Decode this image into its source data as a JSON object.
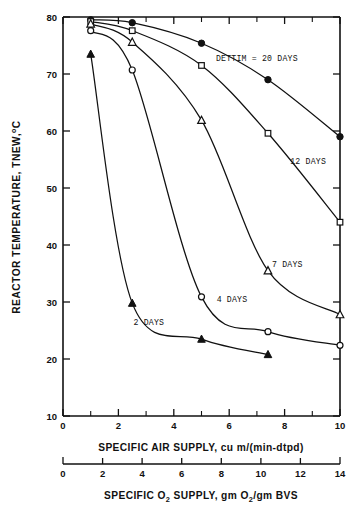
{
  "chart_data": {
    "type": "line",
    "title": "",
    "xlabel": "SPECIFIC AIR SUPPLY, cu m/(min-dtpd)",
    "xlabel_secondary": "SPECIFIC O2 SUPPLY, gm O2/gm BVS",
    "ylabel": "REACTOR TEMPERATURE, TNEW, °C",
    "xlim": [
      0,
      10
    ],
    "ylim": [
      10,
      80
    ],
    "xticks": [
      0,
      2,
      4,
      6,
      8,
      10
    ],
    "xticklabels": [
      "0",
      "2",
      "4",
      "6",
      "8",
      "10"
    ],
    "xticks_minor": [
      1,
      3,
      5,
      7,
      9
    ],
    "yticks": [
      10,
      20,
      30,
      40,
      50,
      60,
      70,
      80
    ],
    "yticklabels": [
      "10",
      "20",
      "30",
      "40",
      "50",
      "60",
      "70",
      "80"
    ],
    "xlim_secondary": [
      0,
      14
    ],
    "xticks_secondary": [
      0,
      2,
      4,
      6,
      8,
      10,
      12,
      14
    ],
    "xticklabels_secondary": [
      "0",
      "2",
      "4",
      "6",
      "8",
      "10",
      "12",
      "14"
    ],
    "grid": false,
    "legend": "inline-annotations",
    "series": [
      {
        "name": "DETTIM = 20 DAYS",
        "marker": "filled-circle",
        "x": [
          1.0,
          2.5,
          5.0,
          7.4,
          10.0
        ],
        "y": [
          79.5,
          79.0,
          75.4,
          69.0,
          59.0
        ]
      },
      {
        "name": "12 DAYS",
        "marker": "open-square",
        "x": [
          1.0,
          2.5,
          5.0,
          7.4,
          10.0
        ],
        "y": [
          79.2,
          77.6,
          71.5,
          59.6,
          44.0
        ]
      },
      {
        "name": "7 DAYS",
        "marker": "open-triangle",
        "x": [
          1.0,
          2.5,
          5.0,
          7.4,
          10.0
        ],
        "y": [
          78.8,
          75.6,
          61.9,
          35.5,
          27.8
        ]
      },
      {
        "name": "4 DAYS",
        "marker": "open-circle",
        "x": [
          1.0,
          2.5,
          5.0,
          7.4,
          10.0
        ],
        "y": [
          77.6,
          70.7,
          30.9,
          24.8,
          22.4
        ]
      },
      {
        "name": "2 DAYS",
        "marker": "filled-triangle",
        "x": [
          1.0,
          2.5,
          5.0,
          7.4
        ],
        "y": [
          73.5,
          29.8,
          23.5,
          20.8
        ]
      }
    ],
    "annotations": [
      {
        "text": "DETTIM = 20 DAYS",
        "x": 7.0,
        "y": 72.2
      },
      {
        "text": "12 DAYS",
        "x": 8.85,
        "y": 54.2
      },
      {
        "text": "7 DAYS",
        "x": 8.1,
        "y": 36.2
      },
      {
        "text": "4 DAYS",
        "x": 6.1,
        "y": 30.0
      },
      {
        "text": "2 DAYS",
        "x": 3.1,
        "y": 26.0
      }
    ]
  },
  "axis": {
    "y_title_main": "REACTOR TEMPERATURE, TNEW,",
    "y_title_degree": "o",
    "y_title_unit": "C",
    "x_title_primary": "SPECIFIC AIR SUPPLY, cu m/(min-dtpd)",
    "x_title_secondary_p1": "SPECIFIC O",
    "x_title_secondary_sub1": "2",
    "x_title_secondary_p2": " SUPPLY, gm O",
    "x_title_secondary_sub2": "2",
    "x_title_secondary_p3": "/gm BVS"
  },
  "colors": {
    "ink": "#111111",
    "background": "#ffffff"
  }
}
